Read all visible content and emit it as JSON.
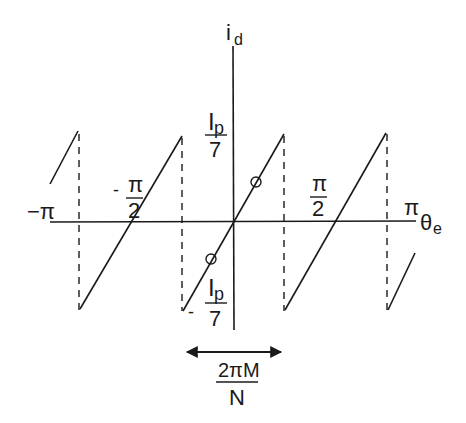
{
  "diagram": {
    "type": "sawtooth-waveform",
    "y_axis": {
      "label": "i",
      "label_subscript": "d"
    },
    "x_axis": {
      "label": "θ",
      "label_subscript": "e"
    },
    "x_ticks": [
      {
        "name": "minus-pi",
        "label": "−π"
      },
      {
        "name": "minus-pi-half",
        "sign": "-",
        "numerator": "π",
        "denominator": "2"
      },
      {
        "name": "pi-half",
        "numerator": "π",
        "denominator": "2"
      },
      {
        "name": "pi",
        "label": "π"
      }
    ],
    "y_ticks": [
      {
        "name": "ip-over-7",
        "numerator": "I",
        "numerator_subscript": "p",
        "denominator": "7"
      },
      {
        "name": "minus-ip-over-7",
        "sign": "-",
        "numerator": "I",
        "numerator_subscript": "p",
        "denominator": "7"
      }
    ],
    "period_annotation": {
      "numerator": "2πM",
      "denominator": "N"
    },
    "colors": {
      "stroke": "#1a1a1a",
      "background": "#ffffff"
    }
  }
}
